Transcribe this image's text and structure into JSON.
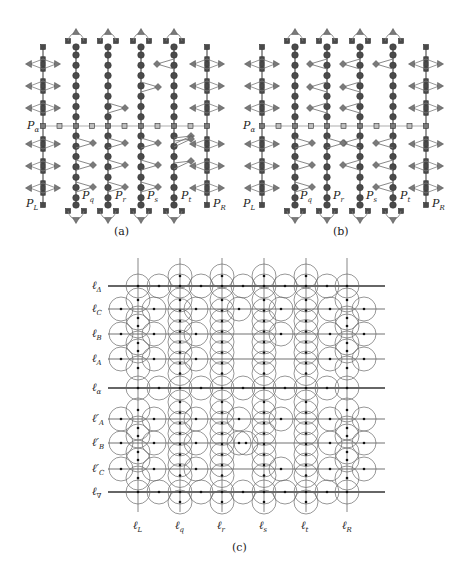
{
  "figure": {
    "panels": [
      {
        "id": "a",
        "caption": "(a)",
        "row_label": {
          "base": "P",
          "sub": "α"
        },
        "columns": [
          {
            "base": "P",
            "sub": "L",
            "type": "boundary"
          },
          {
            "base": "P",
            "sub": "q",
            "type": "path"
          },
          {
            "base": "P",
            "sub": "r",
            "type": "path"
          },
          {
            "base": "P",
            "sub": "s",
            "type": "path"
          },
          {
            "base": "P",
            "sub": "t",
            "type": "path"
          },
          {
            "base": "P",
            "sub": "R",
            "type": "boundary"
          }
        ],
        "pendants": [
          {
            "col": 1,
            "slots": [
              4,
              5,
              6
            ],
            "side": "right"
          },
          {
            "col": 2,
            "slots": [
              2
            ],
            "side": "right"
          },
          {
            "col": 2,
            "slots": [
              4,
              5,
              6
            ],
            "side": "right"
          },
          {
            "col": 3,
            "slots": [
              1
            ],
            "side": "right"
          },
          {
            "col": 3,
            "slots": [
              4,
              5,
              6
            ],
            "side": "right"
          },
          {
            "col": 4,
            "slots": [
              0
            ],
            "side": "left"
          },
          {
            "col": 4,
            "slots": [
              3,
              4,
              5
            ],
            "side": "right-up"
          }
        ]
      },
      {
        "id": "b",
        "caption": "(b)",
        "row_label": {
          "base": "P",
          "sub": "α"
        },
        "columns": [
          {
            "base": "P",
            "sub": "L",
            "type": "boundary"
          },
          {
            "base": "P",
            "sub": "q",
            "type": "path"
          },
          {
            "base": "P",
            "sub": "r",
            "type": "path"
          },
          {
            "base": "P",
            "sub": "s",
            "type": "path"
          },
          {
            "base": "P",
            "sub": "t",
            "type": "path"
          },
          {
            "base": "P",
            "sub": "R",
            "type": "boundary"
          }
        ],
        "pendants": [
          {
            "col": 1,
            "slots": [
              4,
              5,
              6
            ],
            "side": "right"
          },
          {
            "col": 2,
            "slots": [
              0,
              1,
              2
            ],
            "side": "left"
          },
          {
            "col": 2,
            "slots": [
              4
            ],
            "side": "right"
          },
          {
            "col": 3,
            "slots": [
              0,
              1,
              2
            ],
            "side": "left"
          },
          {
            "col": 3,
            "slots": [
              4,
              5
            ],
            "side": "left"
          },
          {
            "col": 4,
            "slots": [
              0
            ],
            "side": "left"
          },
          {
            "col": 4,
            "slots": [
              4,
              5,
              6
            ],
            "side": "left"
          }
        ]
      },
      {
        "id": "c",
        "caption": "(c)",
        "horizontal_lines": [
          {
            "base": "ℓ",
            "sub": "Δ",
            "prime": false,
            "bold": true
          },
          {
            "base": "ℓ",
            "sub": "C",
            "prime": false,
            "bold": false
          },
          {
            "base": "ℓ",
            "sub": "B",
            "prime": false,
            "bold": false
          },
          {
            "base": "ℓ",
            "sub": "A",
            "prime": false,
            "bold": false
          },
          {
            "base": "ℓ",
            "sub": "α",
            "prime": false,
            "bold": true
          },
          {
            "base": "ℓ",
            "sub": "A",
            "prime": true,
            "bold": false
          },
          {
            "base": "ℓ",
            "sub": "B",
            "prime": true,
            "bold": false
          },
          {
            "base": "ℓ",
            "sub": "C",
            "prime": true,
            "bold": false
          },
          {
            "base": "ℓ",
            "sub": "∇",
            "prime": false,
            "bold": true
          }
        ],
        "vertical_lines": [
          {
            "base": "ℓ",
            "sub": "L"
          },
          {
            "base": "ℓ",
            "sub": "q"
          },
          {
            "base": "ℓ",
            "sub": "r"
          },
          {
            "base": "ℓ",
            "sub": "s"
          },
          {
            "base": "ℓ",
            "sub": "t"
          },
          {
            "base": "ℓ",
            "sub": "R"
          }
        ]
      }
    ],
    "colors": {
      "node_dark": "#4a4a4a",
      "node_mid": "#7a7a7a",
      "node_light": "#bdbdbd",
      "edge": "#555555",
      "alpha_edge": "#c8c8c8",
      "circle": "#6a6a6a",
      "line": "#333333"
    }
  }
}
